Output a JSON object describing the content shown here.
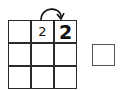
{
  "grid": {
    "rows": 3,
    "cols": 3,
    "cells": [
      [
        "",
        "2",
        "2"
      ],
      [
        "",
        "",
        ""
      ],
      [
        "",
        "",
        ""
      ]
    ],
    "emphasis": [
      [
        "",
        "normal",
        "bold"
      ],
      [
        "",
        "",
        ""
      ],
      [
        "",
        "",
        ""
      ]
    ]
  },
  "arrow": {
    "from": "row0-col1",
    "to": "row0-col2",
    "icon": "curved-arrow-icon"
  },
  "side_box": {
    "value": ""
  }
}
